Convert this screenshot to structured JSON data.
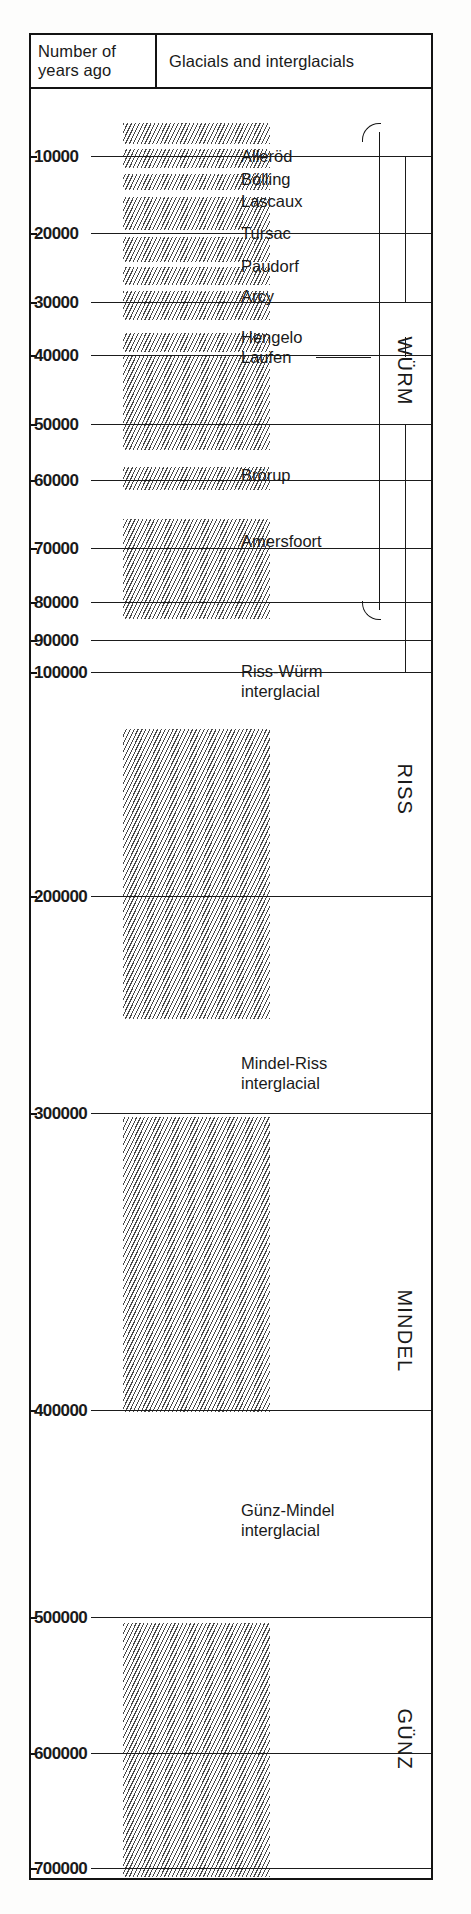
{
  "figure": {
    "title_visible": false,
    "headers": {
      "left_line1": "Number of",
      "left_line2": "years ago",
      "right": "Glacials and interglacials"
    }
  },
  "chart_data": {
    "type": "table",
    "title": "Glacials and interglacials",
    "xlabel": "",
    "ylabel": "Number of years ago",
    "ylim": [
      0,
      700000
    ],
    "axis_direction": "downward-increasing",
    "grid": false,
    "legend": "none",
    "tick_labels": [
      "10000",
      "20000",
      "30000",
      "40000",
      "50000",
      "60000",
      "70000",
      "80000",
      "90000",
      "100000",
      "200000",
      "300000",
      "400000",
      "500000",
      "600000",
      "700000"
    ],
    "tick_values": [
      10000,
      20000,
      30000,
      40000,
      50000,
      60000,
      70000,
      80000,
      90000,
      100000,
      200000,
      300000,
      400000,
      500000,
      600000,
      700000
    ],
    "interstadial_labels": [
      {
        "name": "Alleröd",
        "years_ago": 10000
      },
      {
        "name": "Bölling",
        "years_ago": 13000
      },
      {
        "name": "Lascaux",
        "years_ago": 16000
      },
      {
        "name": "Tursac",
        "years_ago": 20000
      },
      {
        "name": "Paudorf",
        "years_ago": 24000
      },
      {
        "name": "Arcy",
        "years_ago": 28000
      },
      {
        "name": "Hengelo",
        "years_ago": 37000
      },
      {
        "name": "Laufen",
        "years_ago": 40000
      },
      {
        "name": "Brörup",
        "years_ago": 56000
      },
      {
        "name": "Amersfoort",
        "years_ago": 65000
      }
    ],
    "interglacial_labels": [
      {
        "name_line1": "Riss-Würm",
        "name_line2": "interglacial",
        "years_ago_range": [
          100000,
          200000
        ]
      },
      {
        "name_line1": "Mindel-Riss",
        "name_line2": "interglacial",
        "years_ago_range": [
          200000,
          300000
        ]
      },
      {
        "name_line1": "Günz-Mindel",
        "name_line2": "interglacial",
        "years_ago_range": [
          400000,
          500000
        ]
      }
    ],
    "glacial_stages": [
      {
        "name": "WÜRM",
        "years_ago_range": [
          10000,
          100000
        ]
      },
      {
        "name": "RISS",
        "years_ago_range": [
          100000,
          200000
        ]
      },
      {
        "name": "MINDEL",
        "years_ago_range": [
          300000,
          400000
        ]
      },
      {
        "name": "GÜNZ",
        "years_ago_range": [
          500000,
          700000
        ]
      }
    ],
    "cold_phase_bands_years_ago": [
      [
        8500,
        11500
      ],
      [
        12800,
        15200
      ],
      [
        16500,
        19000
      ],
      [
        20500,
        25500
      ],
      [
        27000,
        31500
      ],
      [
        33000,
        36000
      ],
      [
        38000,
        42000
      ],
      [
        43500,
        55500
      ],
      [
        58000,
        61000
      ],
      [
        64500,
        88000
      ],
      [
        118000,
        207000
      ],
      [
        303000,
        403000
      ],
      [
        503000,
        665000
      ]
    ]
  },
  "ticks": [
    {
      "label": "10000",
      "y": 67
    },
    {
      "label": "20000",
      "y": 144
    },
    {
      "label": "30000",
      "y": 213
    },
    {
      "label": "40000",
      "y": 266
    },
    {
      "label": "50000",
      "y": 335
    },
    {
      "label": "60000",
      "y": 391
    },
    {
      "label": "70000",
      "y": 459
    },
    {
      "label": "80000",
      "y": 513
    },
    {
      "label": "90000",
      "y": 551
    },
    {
      "label": "100000",
      "y": 583
    },
    {
      "label": "200000",
      "y": 807
    },
    {
      "label": "300000",
      "y": 1024
    },
    {
      "label": "400000",
      "y": 1321
    },
    {
      "label": "500000",
      "y": 1528
    },
    {
      "label": "600000",
      "y": 1664
    },
    {
      "label": "700000",
      "y": 1779
    }
  ],
  "events": [
    {
      "label": "Alleröd",
      "y": 67
    },
    {
      "label": "Bölling",
      "y": 90
    },
    {
      "label": "Lascaux",
      "y": 112
    },
    {
      "label": "Tursac",
      "y": 144
    },
    {
      "label": "Paudorf",
      "y": 177
    },
    {
      "label": "Arcy",
      "y": 207
    },
    {
      "label": "Hengelo",
      "y": 248
    },
    {
      "label": "Laufen",
      "y": 268
    },
    {
      "label": "Brörup",
      "y": 386
    },
    {
      "label": "Amersfoort",
      "y": 452
    }
  ],
  "interglacials": [
    {
      "line1": "Riss-Würm",
      "line2": "interglacial",
      "y": 583
    },
    {
      "line1": "Mindel-Riss",
      "line2": "interglacial",
      "y": 975
    },
    {
      "line1": "Günz-Mindel",
      "line2": "interglacial",
      "y": 1422
    }
  ],
  "stages": [
    {
      "name": "WÜRM",
      "cy": 282,
      "bracket_top": 34,
      "bracket_bottom": 530
    },
    {
      "name": "RISS",
      "cy": 700
    },
    {
      "name": "MINDEL",
      "cy": 1242
    },
    {
      "name": "GÜNZ",
      "cy": 1650
    }
  ],
  "bars": [
    {
      "top": 34,
      "height": 21,
      "left": 92,
      "width": 147
    },
    {
      "top": 60,
      "height": 19,
      "left": 92,
      "width": 147
    },
    {
      "top": 85,
      "height": 16,
      "left": 92,
      "width": 147
    },
    {
      "top": 108,
      "height": 33,
      "left": 92,
      "width": 147
    },
    {
      "top": 148,
      "height": 25,
      "left": 92,
      "width": 147
    },
    {
      "top": 178,
      "height": 18,
      "left": 92,
      "width": 147
    },
    {
      "top": 202,
      "height": 29,
      "left": 92,
      "width": 147
    },
    {
      "top": 244,
      "height": 19,
      "left": 92,
      "width": 147
    },
    {
      "top": 267,
      "height": 94,
      "left": 92,
      "width": 147
    },
    {
      "top": 378,
      "height": 23,
      "left": 92,
      "width": 147
    },
    {
      "top": 430,
      "height": 100,
      "left": 92,
      "width": 147
    },
    {
      "top": 640,
      "height": 290,
      "left": 92,
      "width": 147
    },
    {
      "top": 1028,
      "height": 295,
      "left": 92,
      "width": 147
    },
    {
      "top": 1534,
      "height": 254,
      "left": 92,
      "width": 147
    }
  ],
  "colors": {
    "ink": "#131313",
    "rule": "#1b1b1b",
    "hatch": "#4a4a4a",
    "paper": "#ffffff",
    "page": "#fdfdfc"
  }
}
